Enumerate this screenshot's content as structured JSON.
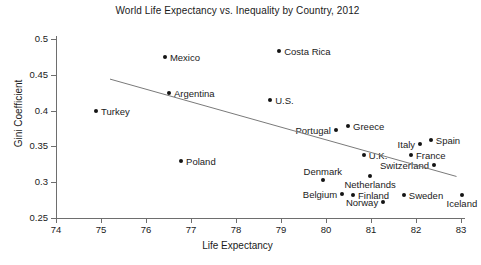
{
  "chart_data": {
    "type": "scatter",
    "title": "World Life Expectancy vs. Inequality by Country, 2012",
    "xlabel": "Life Expectancy",
    "ylabel": "Gini Coefficient",
    "xlim": [
      74,
      83
    ],
    "ylim": [
      0.25,
      0.5
    ],
    "xticks": [
      74,
      75,
      76,
      77,
      78,
      79,
      80,
      81,
      82,
      83
    ],
    "xtick_labels": [
      "74",
      "75",
      "76",
      "77",
      "78",
      "79",
      "80",
      "81",
      "82",
      "83"
    ],
    "yticks": [
      0.25,
      0.3,
      0.35,
      0.4,
      0.45,
      0.5
    ],
    "ytick_labels": [
      "0.25",
      "0.3",
      "0.35",
      "0.4",
      "0.45",
      "0.5"
    ],
    "grid": false,
    "legend": "none",
    "marker_color": "#141414",
    "trendline_color": "#7a7a7a",
    "points": [
      {
        "label": "Mexico",
        "x": 76.42,
        "y": 0.475,
        "label_pos": "right"
      },
      {
        "label": "Costa Rica",
        "x": 78.96,
        "y": 0.483,
        "label_pos": "right"
      },
      {
        "label": "Argentina",
        "x": 76.51,
        "y": 0.424,
        "label_pos": "right"
      },
      {
        "label": "Turkey",
        "x": 74.89,
        "y": 0.399,
        "label_pos": "right"
      },
      {
        "label": "U.S.",
        "x": 78.76,
        "y": 0.415,
        "label_pos": "right"
      },
      {
        "label": "Poland",
        "x": 76.78,
        "y": 0.33,
        "label_pos": "right"
      },
      {
        "label": "Portugal",
        "x": 80.22,
        "y": 0.373,
        "label_pos": "left"
      },
      {
        "label": "Greece",
        "x": 80.49,
        "y": 0.378,
        "label_pos": "right"
      },
      {
        "label": "U.K.",
        "x": 80.84,
        "y": 0.338,
        "label_pos": "right"
      },
      {
        "label": "Italy",
        "x": 82.09,
        "y": 0.353,
        "label_pos": "left"
      },
      {
        "label": "Spain",
        "x": 82.33,
        "y": 0.359,
        "label_pos": "right"
      },
      {
        "label": "France",
        "x": 81.89,
        "y": 0.338,
        "label_pos": "right"
      },
      {
        "label": "Switzerland",
        "x": 82.4,
        "y": 0.324,
        "label_pos": "left"
      },
      {
        "label": "Netherlands",
        "x": 80.98,
        "y": 0.308,
        "label_pos": "below"
      },
      {
        "label": "Denmark",
        "x": 79.93,
        "y": 0.303,
        "label_pos": "above"
      },
      {
        "label": "Belgium",
        "x": 80.36,
        "y": 0.284,
        "label_pos": "left"
      },
      {
        "label": "Finland",
        "x": 80.6,
        "y": 0.282,
        "label_pos": "right"
      },
      {
        "label": "Sweden",
        "x": 81.73,
        "y": 0.282,
        "label_pos": "right"
      },
      {
        "label": "Norway",
        "x": 81.27,
        "y": 0.272,
        "label_pos": "left"
      },
      {
        "label": "Iceland",
        "x": 83.02,
        "y": 0.282,
        "label_pos": "below"
      }
    ],
    "trendline": {
      "x0": 75.2,
      "y0": 0.444,
      "x1": 82.9,
      "y1": 0.308
    }
  }
}
